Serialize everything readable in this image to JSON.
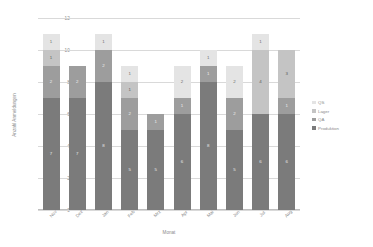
{
  "chart_data": {
    "type": "bar",
    "stacked": true,
    "title": "",
    "xlabel": "Monat",
    "ylabel": "Anzahl Anmeldungen",
    "categories": [
      "Nov",
      "Dez",
      "Jan",
      "Feb",
      "Mrz",
      "Apr",
      "Mai",
      "Jun",
      "Jul",
      "Aug"
    ],
    "ylim": [
      0,
      12
    ],
    "yticks": [
      0,
      2,
      4,
      6,
      8,
      10,
      12
    ],
    "grid": true,
    "legend_position": "right",
    "series": [
      {
        "name": "Produktion",
        "color": "#7b7b7b",
        "values": [
          7,
          7,
          8,
          5,
          5,
          6,
          8,
          5,
          6,
          6
        ]
      },
      {
        "name": "QA",
        "color": "#9d9d9d",
        "values": [
          2,
          2,
          2,
          2,
          1,
          1,
          1,
          2,
          0,
          1
        ]
      },
      {
        "name": "Lager",
        "color": "#c4c4c4",
        "values": [
          1,
          0,
          0,
          1,
          0,
          0,
          0,
          0,
          4,
          3
        ]
      },
      {
        "name": "QS",
        "color": "#e4e4e4",
        "values": [
          1,
          0,
          1,
          1,
          0,
          2,
          1,
          2,
          1,
          0
        ]
      }
    ]
  },
  "legend": {
    "items": [
      {
        "label": "QS",
        "color": "#e4e4e4"
      },
      {
        "label": "Lager",
        "color": "#c4c4c4"
      },
      {
        "label": "QA",
        "color": "#9d9d9d"
      },
      {
        "label": "Produktion",
        "color": "#7b7b7b"
      }
    ]
  }
}
